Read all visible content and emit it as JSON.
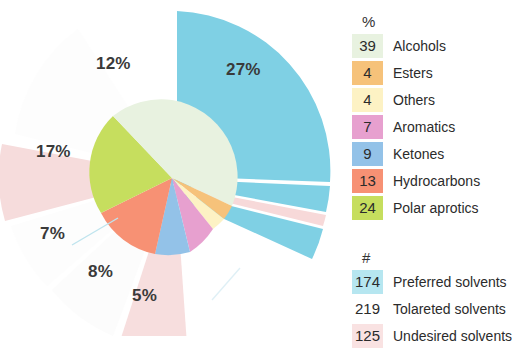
{
  "legend": {
    "percent_header": "%",
    "count_header": "#",
    "percent_items": [
      {
        "value": "39",
        "label": "Alcohols",
        "color": "#e8f2e0"
      },
      {
        "value": "4",
        "label": "Esters",
        "color": "#f6c27a"
      },
      {
        "value": "4",
        "label": "Others",
        "color": "#fdf2c4"
      },
      {
        "value": "7",
        "label": "Aromatics",
        "color": "#e7a0cf"
      },
      {
        "value": "9",
        "label": "Ketones",
        "color": "#93c2e8"
      },
      {
        "value": "13",
        "label": "Hydrocarbons",
        "color": "#f79174"
      },
      {
        "value": "24",
        "label": "Polar aprotics",
        "color": "#c6de5e"
      }
    ],
    "count_items": [
      {
        "value": "174",
        "label": "Preferred solvents",
        "color": "#b6e6f0"
      },
      {
        "value": "219",
        "label": "Tolareted solvents",
        "color": "#ffffff"
      },
      {
        "value": "125",
        "label": "Undesired solvents",
        "color": "#f9e2e2"
      }
    ]
  },
  "chart_data": {
    "type": "pie",
    "title": "",
    "inner_ring": {
      "name": "Solvent class",
      "unit": "%",
      "categories": [
        "Alcohols",
        "Polar aprotics",
        "Hydrocarbons",
        "Ketones",
        "Aromatics",
        "Others",
        "Esters"
      ],
      "values": [
        39,
        24,
        13,
        9,
        7,
        4,
        4
      ],
      "colors": [
        "#e8f2e0",
        "#c6de5e",
        "#f79174",
        "#93c2e8",
        "#e7a0cf",
        "#fdf2c4",
        "#f6c27a"
      ]
    },
    "outer_ring": {
      "name": "Solvent desirability",
      "unit": "%",
      "categories": [
        "Preferred",
        "Tolareted",
        "Undesired",
        "Preferred",
        "Tolareted",
        "Undesired",
        "Preferred",
        "Undesired",
        "Preferred"
      ],
      "values": [
        27,
        12,
        17,
        7,
        8,
        5,
        9,
        2,
        13
      ],
      "colors": [
        "#7fd0e4",
        "#fdfdfd",
        "#f6dcdc",
        "#fdfdfd",
        "#fdfdfd",
        "#f6dcdc",
        "#7fd0e4",
        "#f9dada",
        "#7fd0e4"
      ]
    },
    "labels": [
      {
        "text": "27%",
        "x": 248,
        "y": 70
      },
      {
        "text": "12%",
        "x": 105,
        "y": 60
      },
      {
        "text": "17%",
        "x": 43,
        "y": 150
      },
      {
        "text": "7%",
        "x": 44,
        "y": 230
      },
      {
        "text": "8%",
        "x": 95,
        "y": 268
      },
      {
        "text": "5%",
        "x": 140,
        "y": 290
      }
    ],
    "legend_counts": {
      "Preferred solvents": 174,
      "Tolareted solvents": 219,
      "Undesired solvents": 125
    }
  }
}
